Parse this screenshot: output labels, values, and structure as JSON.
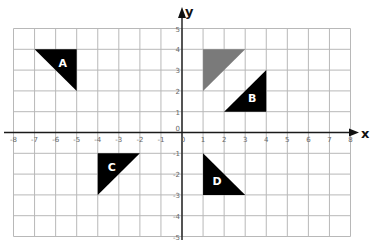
{
  "chart_data": {
    "type": "coordinate-grid",
    "title": "",
    "xlabel": "x",
    "ylabel": "y",
    "xlim": [
      -8,
      8
    ],
    "ylim": [
      -5,
      5
    ],
    "grid": true,
    "x_ticks": [
      -8,
      -7,
      -6,
      -5,
      -4,
      -3,
      -2,
      -1,
      0,
      1,
      2,
      3,
      4,
      5,
      6,
      7,
      8
    ],
    "y_ticks": [
      -5,
      -4,
      -3,
      -2,
      -1,
      0,
      1,
      2,
      3,
      4,
      5
    ],
    "shapes": [
      {
        "label": "",
        "name": "original-triangle",
        "color": "#7a7a7a",
        "vertices": [
          [
            1,
            4
          ],
          [
            3,
            4
          ],
          [
            1,
            2
          ]
        ]
      },
      {
        "label": "A",
        "name": "triangle-a",
        "color": "#000000",
        "vertices": [
          [
            -7,
            4
          ],
          [
            -5,
            4
          ],
          [
            -5,
            2
          ]
        ]
      },
      {
        "label": "B",
        "name": "triangle-b",
        "color": "#000000",
        "vertices": [
          [
            4,
            3
          ],
          [
            4,
            1
          ],
          [
            2,
            1
          ]
        ]
      },
      {
        "label": "C",
        "name": "triangle-c",
        "color": "#000000",
        "vertices": [
          [
            -4,
            -1
          ],
          [
            -2,
            -1
          ],
          [
            -4,
            -3
          ]
        ]
      },
      {
        "label": "D",
        "name": "triangle-d",
        "color": "#000000",
        "vertices": [
          [
            1,
            -1
          ],
          [
            1,
            -3
          ],
          [
            3,
            -3
          ]
        ]
      }
    ]
  },
  "colors": {
    "grid": "#b8b8b8",
    "axis": "#1a1a1a",
    "tick_label": "#666666",
    "shape_dark": "#000000",
    "shape_gray": "#7a7a7a"
  }
}
